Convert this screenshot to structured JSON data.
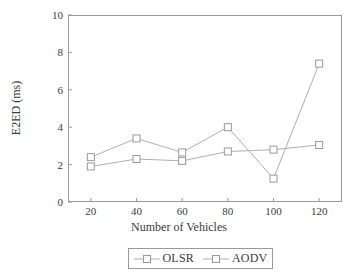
{
  "chart_data": {
    "type": "line",
    "title": "",
    "xlabel": "Number of Vehicles",
    "ylabel": "E2ED (ms)",
    "x": [
      20,
      40,
      60,
      80,
      100,
      120
    ],
    "xlim": [
      10,
      130
    ],
    "ylim": [
      0,
      10
    ],
    "xticks": [
      20,
      40,
      60,
      80,
      100,
      120
    ],
    "yticks": [
      0,
      2,
      4,
      6,
      8,
      10
    ],
    "xtick_labels": [
      "20",
      "40",
      "60",
      "80",
      "100",
      "120"
    ],
    "ytick_labels": [
      "0",
      "2",
      "4",
      "6",
      "8",
      "10"
    ],
    "grid": false,
    "legend_position": "below-axis",
    "marker": "open-square",
    "line_color": "#b0b0b0",
    "marker_edge_color": "#9a9a9a",
    "axis_color": "#9a9a9a",
    "text_color": "#3d3d3d",
    "series": [
      {
        "name": "OLSR",
        "values": [
          1.9,
          2.3,
          2.2,
          2.7,
          2.8,
          3.05
        ]
      },
      {
        "name": "AODV",
        "values": [
          2.4,
          3.4,
          2.65,
          4.0,
          1.25,
          7.4
        ]
      }
    ]
  },
  "legend": {
    "entries": [
      {
        "label": "OLSR"
      },
      {
        "label": "AODV"
      }
    ]
  },
  "icons": {
    "marker": "open-square-marker-icon"
  }
}
